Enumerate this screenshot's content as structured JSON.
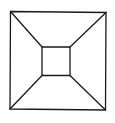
{
  "diagram": {
    "stroke_color": "#1a1a1a",
    "background": "#ffffff",
    "outer_square": {
      "tl": [
        10.5,
        11.5
      ],
      "tr": [
        106,
        12.5
      ],
      "br": [
        105.5,
        110
      ],
      "bl": [
        10,
        109
      ]
    },
    "inner_square": {
      "tl": [
        42,
        47
      ],
      "tr": [
        70,
        47
      ],
      "br": [
        70,
        75.5
      ],
      "bl": [
        42,
        75.5
      ]
    },
    "connectors": [
      {
        "from": "outer.tl",
        "to": "inner.tl"
      },
      {
        "from": "outer.tr",
        "to": "inner.tr"
      },
      {
        "from": "outer.br",
        "to": "inner.br"
      },
      {
        "from": "outer.bl",
        "to": "inner.bl"
      }
    ]
  }
}
